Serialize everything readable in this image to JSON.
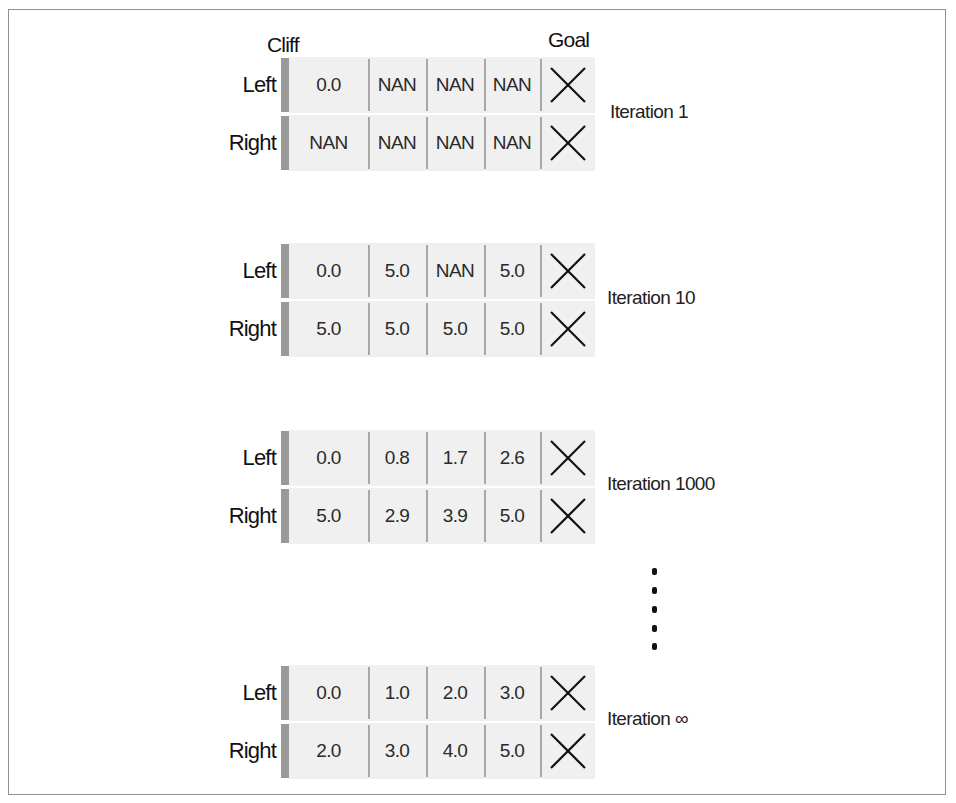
{
  "headers": {
    "cliff": "Cliff",
    "goal": "Goal"
  },
  "row_labels": {
    "left": "Left",
    "right": "Right"
  },
  "icons": {
    "goal_cell": "x-mark-icon",
    "ellipsis": "vertical-ellipsis-icon"
  },
  "colors": {
    "frame_border": "#8f8f8f",
    "cliff_bar": "#9a9a9a",
    "cell_background": "#f0f0f0",
    "cell_divider": "#a8a8a8",
    "text": "#1a1a1a"
  },
  "iterations": [
    {
      "label": "Iteration 1",
      "left": [
        "0.0",
        "NAN",
        "NAN",
        "NAN"
      ],
      "right": [
        "NAN",
        "NAN",
        "NAN",
        "NAN"
      ]
    },
    {
      "label": "Iteration 10",
      "left": [
        "0.0",
        "5.0",
        "NAN",
        "5.0"
      ],
      "right": [
        "5.0",
        "5.0",
        "5.0",
        "5.0"
      ]
    },
    {
      "label": "Iteration 1000",
      "left": [
        "0.0",
        "0.8",
        "1.7",
        "2.6"
      ],
      "right": [
        "5.0",
        "2.9",
        "3.9",
        "5.0"
      ]
    },
    {
      "label": "Iteration ∞",
      "left": [
        "0.0",
        "1.0",
        "2.0",
        "3.0"
      ],
      "right": [
        "2.0",
        "3.0",
        "4.0",
        "5.0"
      ]
    }
  ]
}
